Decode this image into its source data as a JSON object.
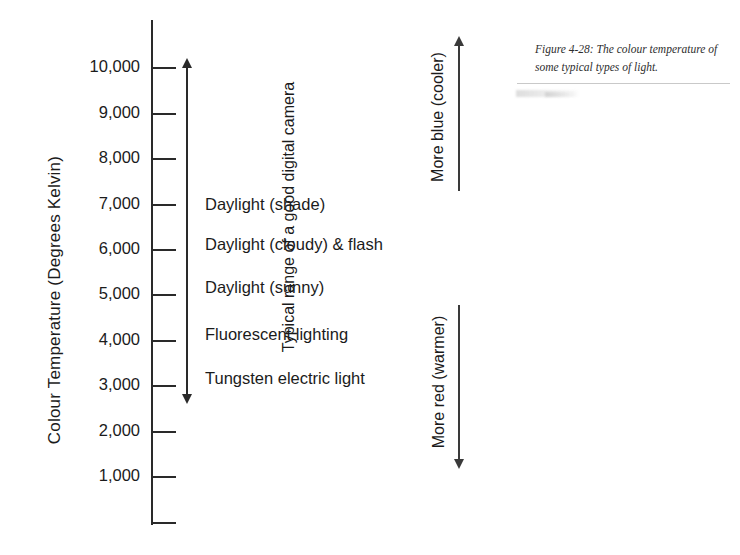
{
  "figure": {
    "caption": "Figure 4-28: The colour temperature of some typical types of light.",
    "axis_title": "Colour Temperature (Degrees Kelvin)"
  },
  "chart_data": {
    "type": "bar",
    "title": "Figure 4-28: The colour temperature of some typical types of light.",
    "ylabel": "Colour Temperature (Degrees Kelvin)",
    "xlabel": "",
    "ylim": [
      0,
      10500
    ],
    "grid": false,
    "legend": "none",
    "axis_ticks": [
      {
        "value": 10000,
        "label": "10,000"
      },
      {
        "value": 9000,
        "label": "9,000"
      },
      {
        "value": 8000,
        "label": "8,000"
      },
      {
        "value": 7000,
        "label": "7,000"
      },
      {
        "value": 6000,
        "label": "6,000"
      },
      {
        "value": 5000,
        "label": "5,000"
      },
      {
        "value": 4000,
        "label": "4,000"
      },
      {
        "value": 3000,
        "label": "3,000"
      },
      {
        "value": 2000,
        "label": "2,000"
      },
      {
        "value": 1000,
        "label": "1,000"
      },
      {
        "value": 0,
        "label": ""
      }
    ],
    "categories": [
      "Daylight (shade)",
      "Daylight (cloudy) & flash",
      "Daylight (sunny)",
      "Fluorescent lighting",
      "Tungsten electric light"
    ],
    "values": [
      7000,
      6100,
      5200,
      4100,
      3200
    ],
    "annotations": [
      {
        "name": "camera-range",
        "text": "Typical range of a good digital camera",
        "from": 3000,
        "to": 10000,
        "style": "double-headed-arrow"
      },
      {
        "name": "more-blue",
        "text": "More blue (cooler)",
        "direction": "up"
      },
      {
        "name": "more-red",
        "text": "More red (warmer)",
        "direction": "down"
      }
    ]
  },
  "scale": {
    "ticks": [
      {
        "label": "10,000",
        "top": 67
      },
      {
        "label": "9,000",
        "top": 113
      },
      {
        "label": "8,000",
        "top": 158
      },
      {
        "label": "7,000",
        "top": 204
      },
      {
        "label": "6,000",
        "top": 249
      },
      {
        "label": "5,000",
        "top": 294
      },
      {
        "label": "4,000",
        "top": 340
      },
      {
        "label": "3,000",
        "top": 385
      },
      {
        "label": "2,000",
        "top": 431
      },
      {
        "label": "1,000",
        "top": 476
      },
      {
        "label": "",
        "top": 522
      }
    ]
  },
  "light_labels": [
    {
      "text": "Daylight (shade)",
      "top": 204
    },
    {
      "text": "Daylight (cloudy) & flash",
      "top": 244
    },
    {
      "text": "Daylight (sunny)",
      "top": 287
    },
    {
      "text": "Fluorescent lighting",
      "top": 334
    },
    {
      "text": "Tungsten electric light",
      "top": 378
    }
  ],
  "range_annotation": {
    "label": "Typical range of a good digital camera"
  },
  "direction_arrows": [
    {
      "label": "More blue (cooler)",
      "direction": "up",
      "top": 45,
      "height": 146
    },
    {
      "label": "More red (warmer)",
      "direction": "down",
      "top": 305,
      "height": 155
    }
  ]
}
